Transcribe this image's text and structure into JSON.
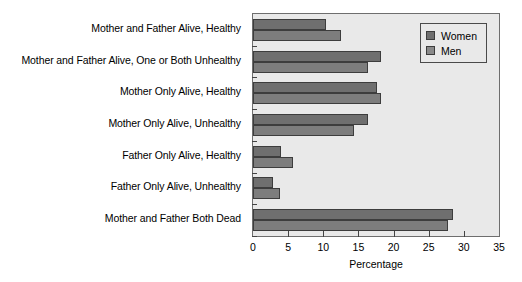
{
  "chart_data": {
    "type": "bar",
    "orientation": "horizontal",
    "title": "",
    "xlabel": "Percentage",
    "ylabel": "",
    "xlim": [
      0,
      35
    ],
    "xticks": [
      0,
      5,
      10,
      15,
      20,
      25,
      30,
      35
    ],
    "grid": false,
    "legend_position": "top-right",
    "categories": [
      "Mother and Father Alive, Healthy",
      "Mother and Father Alive, One or Both Unhealthy",
      "Mother Only Alive, Healthy",
      "Mother Only Alive, Unhealthy",
      "Father Only Alive, Healthy",
      "Father Only Alive, Unhealthy",
      "Mother and Father Both Dead"
    ],
    "series": [
      {
        "name": "Women",
        "color": "#6f6f6f",
        "values": [
          10.4,
          18.2,
          17.6,
          16.4,
          4.0,
          2.9,
          28.4
        ]
      },
      {
        "name": "Men",
        "color": "#7d7d7d",
        "values": [
          12.5,
          16.4,
          18.2,
          14.4,
          5.7,
          3.9,
          27.7
        ]
      }
    ]
  },
  "legend": {
    "items": [
      {
        "label": "Women"
      },
      {
        "label": "Men"
      }
    ]
  },
  "axis": {
    "x_title": "Percentage",
    "tick_labels": [
      "0",
      "5",
      "10",
      "15",
      "20",
      "25",
      "30",
      "35"
    ]
  }
}
